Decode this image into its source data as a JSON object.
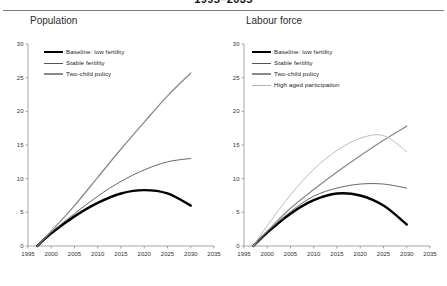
{
  "figure": {
    "title": "1995–2035",
    "panels": [
      {
        "id": "population",
        "title": "Population"
      },
      {
        "id": "labour-force",
        "title": "Labour force"
      }
    ]
  },
  "colors": {
    "baseline": "#000000",
    "stable": "#555555",
    "two_child": "#8a8a8a",
    "high_aged": "#b4b4b4",
    "axis": "#8f8f8f",
    "rule": "#7d7d7d",
    "text": "#1c1c1c"
  },
  "chart_data": [
    {
      "type": "line",
      "id": "population",
      "title": "Population",
      "xlabel": "",
      "ylabel": "",
      "xlim": [
        1995,
        2035
      ],
      "ylim": [
        0,
        30
      ],
      "xticks": [
        1995,
        2000,
        2005,
        2010,
        2015,
        2020,
        2025,
        2030,
        2035
      ],
      "yticks": [
        0,
        5,
        10,
        15,
        20,
        25,
        30
      ],
      "grid": false,
      "legend_position": "upper-left-inside",
      "x": [
        1997,
        2000,
        2005,
        2010,
        2015,
        2020,
        2025,
        2030
      ],
      "series": [
        {
          "name": "Baseline: low fertility",
          "color": "#000000",
          "width": 2.4,
          "values": [
            0.0,
            1.9,
            4.4,
            6.4,
            7.8,
            8.3,
            7.8,
            6.0
          ]
        },
        {
          "name": "Stable fertility",
          "color": "#555555",
          "width": 0.9,
          "values": [
            0.0,
            2.0,
            4.8,
            7.4,
            9.6,
            11.3,
            12.5,
            13.0
          ]
        },
        {
          "name": "Two-child policy",
          "color": "#8a8a8a",
          "width": 1.3,
          "values": [
            0.0,
            2.2,
            6.0,
            10.2,
            14.4,
            18.4,
            22.3,
            25.7
          ]
        }
      ]
    },
    {
      "type": "line",
      "id": "labour-force",
      "title": "Labour force",
      "xlabel": "",
      "ylabel": "",
      "xlim": [
        1995,
        2035
      ],
      "ylim": [
        0,
        30
      ],
      "xticks": [
        1995,
        2000,
        2005,
        2010,
        2015,
        2020,
        2025,
        2030,
        2035
      ],
      "yticks": [
        0,
        5,
        10,
        15,
        20,
        25,
        30
      ],
      "grid": false,
      "legend_position": "upper-left-inside",
      "x": [
        1997,
        2000,
        2005,
        2010,
        2015,
        2020,
        2025,
        2030
      ],
      "series": [
        {
          "name": "Baseline: low fertility",
          "color": "#000000",
          "width": 2.4,
          "values": [
            0.0,
            2.0,
            4.8,
            6.8,
            7.8,
            7.5,
            6.0,
            3.2
          ]
        },
        {
          "name": "Stable fertility",
          "color": "#555555",
          "width": 0.9,
          "values": [
            0.0,
            2.1,
            5.1,
            7.4,
            8.6,
            9.2,
            9.2,
            8.6
          ]
        },
        {
          "name": "Two-child policy",
          "color": "#8a8a8a",
          "width": 1.3,
          "values": [
            0.0,
            2.2,
            5.6,
            8.4,
            11.0,
            13.4,
            15.7,
            17.8
          ]
        },
        {
          "name": "High aged participation",
          "color": "#b4b4b4",
          "width": 0.9,
          "values": [
            0.0,
            3.0,
            7.6,
            11.4,
            14.2,
            16.0,
            16.4,
            14.0
          ]
        }
      ]
    }
  ]
}
